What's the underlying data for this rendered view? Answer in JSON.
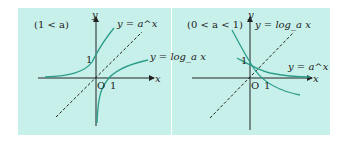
{
  "figures": [
    {
      "condition": "(1 < a)",
      "labels": {
        "y_axis": "y",
        "x_axis": "x",
        "origin": "O",
        "one_x": "1",
        "one_y": "1",
        "exp_curve": "y = a^x",
        "log_curve": "y = log_a x"
      }
    },
    {
      "condition": "(0 < a < 1)",
      "labels": {
        "y_axis": "y",
        "x_axis": "x",
        "origin": "O",
        "one_x": "1",
        "one_y": "1",
        "exp_curve": "y = a^x",
        "log_curve": "y = log_a x"
      }
    }
  ],
  "colors": {
    "background": "#c8f0ea",
    "curve": "#2a9d8a",
    "axis": "#222222"
  }
}
